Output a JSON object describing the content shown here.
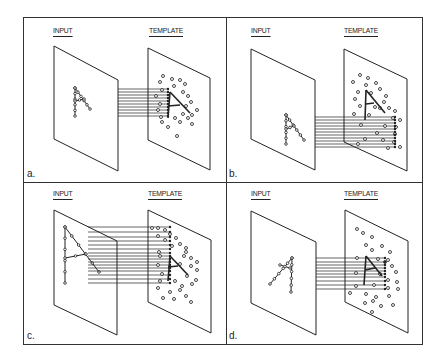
{
  "figure": {
    "input_label": "INPUT",
    "template_label": "TEMPLATE",
    "panels": [
      {
        "id": "a",
        "caption": "a.",
        "description": "Input 'A' same size and position as template 'A'",
        "origin": [
          23,
          17
        ],
        "input_plane": [
          [
            54,
            46
          ],
          [
            118,
            80
          ],
          [
            118,
            171
          ],
          [
            54,
            139
          ]
        ],
        "template_plane": [
          [
            148,
            48
          ],
          [
            210,
            78
          ],
          [
            210,
            170
          ],
          [
            148,
            140
          ]
        ],
        "input_letter": {
          "apex": [
            75,
            88
          ],
          "bl": [
            75,
            116
          ],
          "br": [
            90,
            109
          ],
          "cross": [
            [
              75,
              101
            ],
            [
              84,
              99
            ]
          ]
        },
        "template_letter": {
          "apex": [
            170,
            92
          ],
          "bl": [
            168,
            118
          ],
          "br": [
            190,
            113
          ],
          "cross": [
            [
              168,
              106
            ],
            [
              180,
              105
            ]
          ]
        },
        "lines": {
          "x0": 118,
          "x1": 168,
          "ys": [
            89,
            92,
            95,
            98,
            101,
            104,
            107,
            110,
            113,
            116
          ]
        },
        "template_dots": [
          [
            163,
            76
          ],
          [
            172,
            79
          ],
          [
            160,
            82
          ],
          [
            180,
            80
          ],
          [
            174,
            86
          ],
          [
            185,
            84
          ],
          [
            162,
            90
          ],
          [
            183,
            92
          ],
          [
            188,
            96
          ],
          [
            156,
            96
          ],
          [
            191,
            102
          ],
          [
            160,
            104
          ],
          [
            186,
            106
          ],
          [
            197,
            110
          ],
          [
            158,
            110
          ],
          [
            183,
            114
          ],
          [
            192,
            115
          ],
          [
            161,
            117
          ],
          [
            175,
            118
          ],
          [
            188,
            118
          ],
          [
            162,
            122
          ],
          [
            180,
            122
          ],
          [
            192,
            124
          ],
          [
            168,
            127
          ],
          [
            177,
            136
          ]
        ]
      },
      {
        "id": "b",
        "caption": "b.",
        "description": "Input 'A' displaced relative to template",
        "origin": [
          226,
          17
        ],
        "input_plane": [
          [
            251,
            49
          ],
          [
            315,
            80
          ],
          [
            315,
            170
          ],
          [
            251,
            139
          ]
        ],
        "template_plane": [
          [
            344,
            49
          ],
          [
            407,
            79
          ],
          [
            407,
            171
          ],
          [
            344,
            142
          ]
        ],
        "input_letter": {
          "apex": [
            286,
            115
          ],
          "bl": [
            286,
            144
          ],
          "br": [
            304,
            140
          ],
          "cross": [
            [
              286,
              129
            ],
            [
              294,
              126
            ]
          ]
        },
        "template_letter": {
          "apex": [
            366,
            90
          ],
          "bl": [
            365,
            120
          ],
          "br": [
            385,
            113
          ],
          "cross": [
            [
              366,
              104
            ],
            [
              374,
              103
            ]
          ]
        },
        "lines": {
          "x0": 315,
          "x1": 395,
          "ys": [
            117,
            120,
            123,
            126,
            129,
            132,
            135,
            138,
            141,
            144,
            147
          ]
        },
        "template_dots": [
          [
            360,
            75
          ],
          [
            368,
            78
          ],
          [
            353,
            82
          ],
          [
            366,
            85
          ],
          [
            376,
            83
          ],
          [
            358,
            92
          ],
          [
            380,
            89
          ],
          [
            371,
            93
          ],
          [
            386,
            96
          ],
          [
            355,
            99
          ],
          [
            384,
            102
          ],
          [
            360,
            106
          ],
          [
            375,
            107
          ],
          [
            380,
            108
          ],
          [
            389,
            108
          ],
          [
            395,
            111
          ],
          [
            354,
            114
          ],
          [
            369,
            115
          ],
          [
            393,
            118
          ],
          [
            400,
            120
          ],
          [
            361,
            125
          ],
          [
            385,
            126
          ],
          [
            396,
            127
          ],
          [
            377,
            133
          ],
          [
            395,
            134
          ],
          [
            365,
            139
          ],
          [
            383,
            140
          ],
          [
            394,
            142
          ],
          [
            388,
            148
          ],
          [
            400,
            147
          ],
          [
            358,
            144
          ]
        ]
      },
      {
        "id": "c",
        "caption": "c.",
        "description": "Input 'A' larger than template 'A'",
        "origin": [
          23,
          182
        ],
        "input_plane": [
          [
            54,
            210
          ],
          [
            117,
            241
          ],
          [
            117,
            335
          ],
          [
            54,
            305
          ]
        ],
        "template_plane": [
          [
            148,
            210
          ],
          [
            211,
            240
          ],
          [
            211,
            333
          ],
          [
            148,
            302
          ]
        ],
        "input_letter": {
          "apex": [
            65,
            227
          ],
          "bl": [
            65,
            283
          ],
          "br": [
            99,
            272
          ],
          "cross": [
            [
              65,
              258
            ],
            [
              86,
              254
            ]
          ]
        },
        "template_letter": {
          "apex": [
            170,
            256
          ],
          "bl": [
            168,
            281
          ],
          "br": [
            188,
            275
          ],
          "cross": [
            [
              168,
              267
            ],
            [
              178,
              266
            ]
          ]
        },
        "lines": {
          "x0": 88,
          "x1": 170,
          "ys": [
            227,
            232,
            237,
            241,
            245,
            249,
            253,
            256,
            259,
            262,
            265,
            268,
            271,
            275,
            279,
            283
          ]
        },
        "template_dots": [
          [
            152,
            228
          ],
          [
            158,
            228
          ],
          [
            165,
            230
          ],
          [
            158,
            236
          ],
          [
            170,
            234
          ],
          [
            165,
            240
          ],
          [
            176,
            238
          ],
          [
            180,
            244
          ],
          [
            172,
            246
          ],
          [
            159,
            252
          ],
          [
            186,
            248
          ],
          [
            186,
            252
          ],
          [
            160,
            256
          ],
          [
            184,
            256
          ],
          [
            191,
            258
          ],
          [
            197,
            262
          ],
          [
            158,
            265
          ],
          [
            180,
            264
          ],
          [
            191,
            266
          ],
          [
            197,
            270
          ],
          [
            162,
            274
          ],
          [
            187,
            276
          ],
          [
            196,
            280
          ],
          [
            160,
            281
          ],
          [
            175,
            281
          ],
          [
            182,
            286
          ],
          [
            192,
            284
          ],
          [
            158,
            288
          ],
          [
            170,
            292
          ],
          [
            180,
            290
          ],
          [
            186,
            296
          ],
          [
            163,
            298
          ],
          [
            174,
            299
          ],
          [
            191,
            302
          ]
        ]
      },
      {
        "id": "d",
        "caption": "d.",
        "description": "Input 'A' rotated relative to template",
        "origin": [
          226,
          182
        ],
        "input_plane": [
          [
            251,
            211
          ],
          [
            316,
            242
          ],
          [
            316,
            335
          ],
          [
            251,
            303
          ]
        ],
        "template_plane": [
          [
            345,
            210
          ],
          [
            408,
            241
          ],
          [
            408,
            333
          ],
          [
            345,
            302
          ]
        ],
        "input_letter": {
          "apex": [
            292,
            258
          ],
          "bl": [
            270,
            284
          ],
          "br": [
            291,
            292
          ],
          "cross": [
            [
              280,
              265
            ],
            [
              290,
              268
            ]
          ]
        },
        "template_letter": {
          "apex": [
            366,
            256
          ],
          "bl": [
            364,
            285
          ],
          "br": [
            382,
            276
          ],
          "cross": [
            [
              365,
              270
            ],
            [
              375,
              268
            ]
          ]
        },
        "lines": {
          "x0": 316,
          "x1": 385,
          "ys": [
            258,
            262,
            265,
            268,
            271,
            274,
            277,
            281,
            285,
            289
          ]
        },
        "template_dots": [
          [
            357,
            229
          ],
          [
            363,
            233
          ],
          [
            372,
            237
          ],
          [
            366,
            245
          ],
          [
            372,
            250
          ],
          [
            382,
            246
          ],
          [
            390,
            252
          ],
          [
            357,
            258
          ],
          [
            378,
            259
          ],
          [
            385,
            262
          ],
          [
            388,
            260
          ],
          [
            392,
            266
          ],
          [
            396,
            272
          ],
          [
            356,
            273
          ],
          [
            380,
            274
          ],
          [
            388,
            280
          ],
          [
            397,
            282
          ],
          [
            356,
            286
          ],
          [
            374,
            285
          ],
          [
            388,
            288
          ],
          [
            398,
            289
          ],
          [
            350,
            293
          ],
          [
            366,
            294
          ],
          [
            376,
            297
          ],
          [
            389,
            296
          ],
          [
            365,
            303
          ],
          [
            373,
            301
          ],
          [
            381,
            306
          ],
          [
            393,
            305
          ],
          [
            372,
            312
          ]
        ]
      }
    ]
  }
}
